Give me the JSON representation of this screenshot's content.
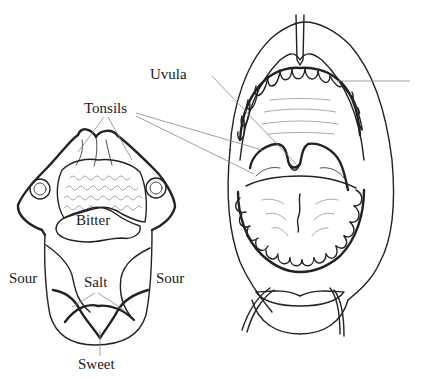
{
  "figure": {
    "stroke_color": "#222222",
    "leader_color": "#888888",
    "background": "#ffffff"
  },
  "labels": {
    "uvula": "Uvula",
    "tonsils": "Tonsils",
    "bitter": "Bitter",
    "sour_left": "Sour",
    "salt": "Salt",
    "sour_right": "Sour",
    "sweet": "Sweet"
  }
}
